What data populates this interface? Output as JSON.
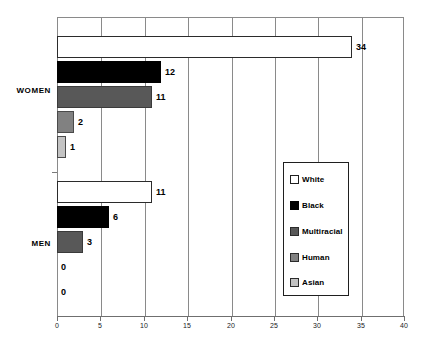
{
  "chart_data": {
    "type": "bar",
    "orientation": "horizontal",
    "title": "",
    "xlabel": "",
    "ylabel": "",
    "xlim": [
      0,
      40
    ],
    "xticks": [
      0,
      5,
      10,
      15,
      20,
      25,
      30,
      35,
      40
    ],
    "xtick_labels": [
      "0",
      "5",
      "10",
      "15",
      "20",
      "25",
      "30",
      "35",
      "40"
    ],
    "grid": true,
    "grid_axis": "x",
    "legend_position": "center-right",
    "categories": [
      "WOMEN",
      "MEN"
    ],
    "series": [
      {
        "name": "White",
        "color": "#ffffff",
        "values": [
          34,
          11
        ]
      },
      {
        "name": "Black",
        "color": "#000000",
        "values": [
          12,
          6
        ]
      },
      {
        "name": "Multiracial",
        "color": "#585858",
        "values": [
          11,
          3
        ]
      },
      {
        "name": "Human",
        "color": "#818181",
        "values": [
          2,
          0
        ]
      },
      {
        "name": "Asian",
        "color": "#c3c3c3",
        "values": [
          1,
          0
        ]
      }
    ],
    "bars": [
      {
        "group": "WOMEN",
        "series": "White",
        "value": 34,
        "label": "34",
        "swatch": "s-white",
        "top": 36,
        "zero": false
      },
      {
        "group": "WOMEN",
        "series": "Black",
        "value": 12,
        "label": "12",
        "swatch": "s-black",
        "top": 61,
        "zero": false
      },
      {
        "group": "WOMEN",
        "series": "Multiracial",
        "value": 11,
        "label": "11",
        "swatch": "s-multi",
        "top": 86,
        "zero": false
      },
      {
        "group": "WOMEN",
        "series": "Human",
        "value": 2,
        "label": "2",
        "swatch": "s-human",
        "top": 111,
        "zero": false
      },
      {
        "group": "WOMEN",
        "series": "Asian",
        "value": 1,
        "label": "1",
        "swatch": "s-asian",
        "top": 136,
        "zero": false
      },
      {
        "group": "MEN",
        "series": "White",
        "value": 11,
        "label": "11",
        "swatch": "s-white",
        "top": 181,
        "zero": false
      },
      {
        "group": "MEN",
        "series": "Black",
        "value": 6,
        "label": "6",
        "swatch": "s-black",
        "top": 206,
        "zero": false
      },
      {
        "group": "MEN",
        "series": "Multiracial",
        "value": 3,
        "label": "3",
        "swatch": "s-multi",
        "top": 231,
        "zero": false
      },
      {
        "group": "MEN",
        "series": "Human",
        "value": 0,
        "label": "0",
        "swatch": "s-human",
        "top": 256,
        "zero": true
      },
      {
        "group": "MEN",
        "series": "Asian",
        "value": 0,
        "label": "0",
        "swatch": "s-asian",
        "top": 281,
        "zero": true
      }
    ],
    "group_labels": [
      {
        "text": "WOMEN",
        "top": 86
      },
      {
        "text": "MEN",
        "top": 239
      }
    ],
    "legend": {
      "items": [
        {
          "label": "White",
          "swatch": "s-white",
          "top": 10
        },
        {
          "label": "Black",
          "swatch": "s-black",
          "top": 36
        },
        {
          "label": "Multiracial",
          "swatch": "s-multi",
          "top": 62
        },
        {
          "label": "Human",
          "swatch": "s-human",
          "top": 88
        },
        {
          "label": "Asian",
          "swatch": "s-asian",
          "top": 113
        }
      ]
    }
  }
}
